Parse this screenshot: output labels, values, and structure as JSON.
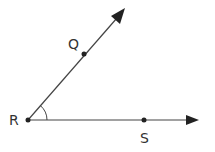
{
  "diagram": {
    "type": "angle",
    "colors": {
      "line": "#444444",
      "point": "#222222",
      "label": "#333333",
      "background": "#ffffff"
    },
    "vertex": {
      "label": "R",
      "x": 28,
      "y": 120
    },
    "points": [
      {
        "label": "Q",
        "x": 84,
        "y": 54,
        "label_x": 73,
        "label_y": 50,
        "on_ray": "RQ"
      },
      {
        "label": "S",
        "x": 144,
        "y": 120,
        "label_x": 145,
        "label_y": 143,
        "on_ray": "RS"
      }
    ],
    "rays": [
      {
        "name": "ray-RQ",
        "from": "R",
        "through": "Q",
        "tip_x": 125,
        "tip_y": 8
      },
      {
        "name": "ray-RS",
        "from": "R",
        "through": "S",
        "tip_x": 199,
        "tip_y": 120
      }
    ],
    "angle_mark": {
      "at": "R",
      "radius": 19
    }
  }
}
